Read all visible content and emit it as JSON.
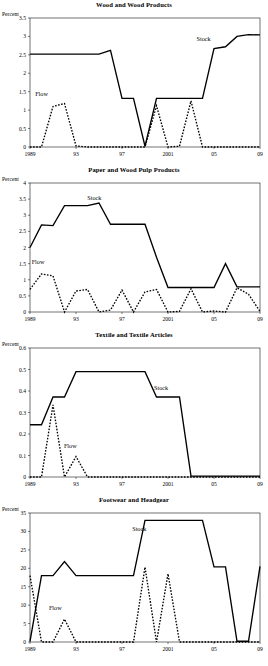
{
  "page": {
    "unit_label": "Percent",
    "series_names": {
      "stock": "Stock",
      "flow": "Flow"
    }
  },
  "chart_data": [
    {
      "type": "line",
      "title": "Wood and Wood Products",
      "xlabel": "",
      "ylabel": "Percent",
      "ylim": [
        0,
        3.5
      ],
      "yticks": [
        0,
        0.5,
        1,
        1.5,
        2,
        2.5,
        3,
        3.5
      ],
      "ytick_labels": [
        "0",
        "0.5",
        "1",
        "1.5",
        "2",
        "2.5",
        "3",
        "3.5"
      ],
      "xlim": [
        1989,
        2009
      ],
      "xticks": [
        1989,
        1993,
        1997,
        2001,
        2005,
        2009
      ],
      "xtick_labels": [
        "1989",
        "93",
        "97",
        "2001",
        "05",
        "09"
      ],
      "grid": false,
      "legend": "inline-annotations",
      "annotations": [
        {
          "text": "Stock",
          "x": 2004.1,
          "y": 2.88
        },
        {
          "text": "Flow",
          "x": 1990.0,
          "y": 1.38
        }
      ],
      "x": [
        1989,
        1990,
        1991,
        1992,
        1993,
        1994,
        1995,
        1996,
        1997,
        1998,
        1999,
        2000,
        2001,
        2002,
        2003,
        2004,
        2005,
        2006,
        2007,
        2008,
        2009
      ],
      "series": [
        {
          "name": "Stock",
          "style": "solid",
          "values": [
            2.52,
            2.52,
            2.52,
            2.52,
            2.52,
            2.52,
            2.52,
            2.62,
            1.32,
            1.32,
            0.02,
            1.32,
            1.32,
            1.32,
            1.32,
            1.32,
            2.67,
            2.72,
            3.0,
            3.05,
            3.04
          ]
        },
        {
          "name": "Flow",
          "style": "dashed",
          "values": [
            0.0,
            0.0,
            1.1,
            1.18,
            0.03,
            0.0,
            0.0,
            0.0,
            0.0,
            0.0,
            0.0,
            1.12,
            0.0,
            0.02,
            1.25,
            0.0,
            0.0,
            0.0,
            0.0,
            0.0,
            0.0
          ]
        }
      ]
    },
    {
      "type": "line",
      "title": "Paper and Wood Pulp Products",
      "xlabel": "",
      "ylabel": "Percent",
      "ylim": [
        0,
        4
      ],
      "yticks": [
        0,
        0.5,
        1,
        1.5,
        2,
        2.5,
        3,
        3.5,
        4
      ],
      "ytick_labels": [
        "0",
        "0.5",
        "1",
        "1.5",
        "2",
        "2.5",
        "3",
        "3.5",
        "4"
      ],
      "xlim": [
        1989,
        2009
      ],
      "xticks": [
        1989,
        1993,
        1997,
        2001,
        2005,
        2009
      ],
      "xtick_labels": [
        "1989",
        "93",
        "97",
        "2001",
        "05",
        "09"
      ],
      "grid": false,
      "legend": "inline-annotations",
      "annotations": [
        {
          "text": "Stock",
          "x": 1994.6,
          "y": 3.47
        },
        {
          "text": "Flow",
          "x": 1989.7,
          "y": 1.5
        }
      ],
      "x": [
        1989,
        1990,
        1991,
        1992,
        1993,
        1994,
        1995,
        1996,
        1997,
        1998,
        1999,
        2000,
        2001,
        2002,
        2003,
        2004,
        2005,
        2006,
        2007,
        2008,
        2009
      ],
      "series": [
        {
          "name": "Stock",
          "style": "solid",
          "values": [
            2.0,
            2.7,
            2.68,
            3.3,
            3.3,
            3.3,
            3.38,
            2.72,
            2.72,
            2.72,
            2.72,
            1.7,
            0.76,
            0.76,
            0.76,
            0.76,
            0.76,
            1.5,
            0.78,
            0.78,
            0.78
          ]
        },
        {
          "name": "Flow",
          "style": "dashed",
          "values": [
            0.7,
            1.18,
            1.12,
            0.0,
            0.65,
            0.7,
            0.0,
            0.06,
            0.68,
            0.0,
            0.62,
            0.7,
            0.0,
            0.02,
            0.72,
            0.0,
            0.03,
            0.0,
            0.75,
            0.55,
            0.02
          ]
        }
      ]
    },
    {
      "type": "line",
      "title": "Textile and Textile Articles",
      "xlabel": "",
      "ylabel": "Percent",
      "ylim": [
        0,
        0.6
      ],
      "yticks": [
        0,
        0.1,
        0.2,
        0.3,
        0.4,
        0.5,
        0.6
      ],
      "ytick_labels": [
        "0",
        "0.1",
        "0.2",
        "0.3",
        "0.4",
        "0.5",
        "0.6"
      ],
      "xlim": [
        1989,
        2009
      ],
      "xticks": [
        1989,
        1993,
        1997,
        2001,
        2005,
        2009
      ],
      "xtick_labels": [
        "1989",
        "93",
        "97",
        "2001",
        "05",
        "09"
      ],
      "grid": false,
      "legend": "inline-annotations",
      "annotations": [
        {
          "text": "Stock",
          "x": 2000.4,
          "y": 0.405
        },
        {
          "text": "Flow",
          "x": 1992.5,
          "y": 0.135
        }
      ],
      "x": [
        1989,
        1990,
        1991,
        1992,
        1993,
        1994,
        1995,
        1996,
        1997,
        1998,
        1999,
        2000,
        2001,
        2002,
        2003,
        2004,
        2005,
        2006,
        2007,
        2008,
        2009
      ],
      "series": [
        {
          "name": "Stock",
          "style": "solid",
          "values": [
            0.243,
            0.243,
            0.372,
            0.372,
            0.49,
            0.49,
            0.49,
            0.49,
            0.49,
            0.49,
            0.49,
            0.372,
            0.372,
            0.372,
            0.004,
            0.004,
            0.004,
            0.004,
            0.004,
            0.004,
            0.004
          ]
        },
        {
          "name": "Flow",
          "style": "dashed",
          "values": [
            0.0,
            0.0,
            0.335,
            0.0,
            0.095,
            0.0,
            0.0,
            0.0,
            0.0,
            0.0,
            0.0,
            0.0,
            0.0,
            0.0,
            0.0,
            0.0,
            0.0,
            0.0,
            0.0,
            0.0,
            0.0
          ]
        }
      ]
    },
    {
      "type": "line",
      "title": "Footwear and Headgear",
      "xlabel": "",
      "ylabel": "Percent",
      "ylim": [
        0,
        35
      ],
      "yticks": [
        0,
        5,
        10,
        15,
        20,
        25,
        30,
        35
      ],
      "ytick_labels": [
        "0",
        "5",
        "10",
        "15",
        "20",
        "25",
        "30",
        "35"
      ],
      "xlim": [
        1989,
        2009
      ],
      "xticks": [
        1989,
        1993,
        1997,
        2001,
        2005,
        2009
      ],
      "xtick_labels": [
        "1989",
        "93",
        "97",
        "2001",
        "05",
        "09"
      ],
      "grid": false,
      "legend": "inline-annotations",
      "annotations": [
        {
          "text": "Stock",
          "x": 1998.5,
          "y": 30.0
        },
        {
          "text": "Flow",
          "x": 1991.2,
          "y": 8.6
        }
      ],
      "x": [
        1989,
        1990,
        1991,
        1992,
        1993,
        1994,
        1995,
        1996,
        1997,
        1998,
        1999,
        2000,
        2001,
        2002,
        2003,
        2004,
        2005,
        2006,
        2007,
        2008,
        2009
      ],
      "series": [
        {
          "name": "Stock",
          "style": "solid",
          "values": [
            0.2,
            18.0,
            18.0,
            21.8,
            18.0,
            18.0,
            18.0,
            18.0,
            18.0,
            18.0,
            33.0,
            33.0,
            33.0,
            33.0,
            33.0,
            33.0,
            20.4,
            20.4,
            0.2,
            0.2,
            20.5
          ]
        },
        {
          "name": "Flow",
          "style": "dashed",
          "values": [
            18.0,
            0.0,
            0.0,
            6.2,
            0.0,
            0.0,
            0.0,
            0.0,
            0.0,
            0.0,
            20.3,
            0.0,
            18.5,
            0.0,
            0.0,
            0.0,
            0.0,
            0.0,
            0.0,
            0.0,
            0.0
          ]
        }
      ]
    }
  ]
}
